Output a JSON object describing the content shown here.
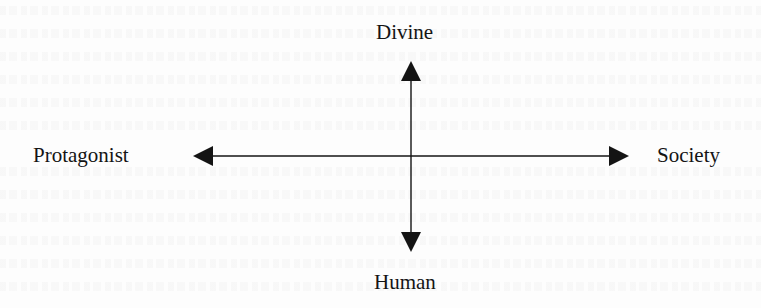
{
  "diagram": {
    "type": "two-axis cross diagram",
    "axes": {
      "vertical": {
        "top": "Divine",
        "bottom": "Human"
      },
      "horizontal": {
        "left": "Protagonist",
        "right": "Society"
      }
    },
    "colors": {
      "ink": "#141414",
      "background": "#fdfdfd"
    }
  }
}
